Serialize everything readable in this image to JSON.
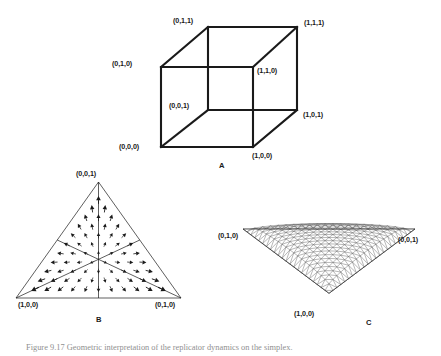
{
  "figure": {
    "background": "#ffffff",
    "ink": "#1a1a1a",
    "mesh_color": "#555555",
    "caption_text": "Figure 9.17   Geometric interpretation of the replicator dynamics on the simplex."
  },
  "panels": [
    {
      "id": "A",
      "letter": "A",
      "kind": "wireframe-cube",
      "vertex_labels": [
        "(0,1,1)",
        "(1,1,1)",
        "(0,1,0)",
        "(1,1,0)",
        "(0,0,1)",
        "(1,0,1)",
        "(0,0,0)",
        "(1,0,0)"
      ]
    },
    {
      "id": "B",
      "letter": "B",
      "kind": "simplex-vector-field",
      "vertex_labels": [
        "(0,0,1)",
        "(1,0,0)",
        "(0,1,0)"
      ]
    },
    {
      "id": "C",
      "letter": "C",
      "kind": "simplex-surface-mesh",
      "vertex_labels": [
        "(0,1,0)",
        "(0,0,1)",
        "(1,0,0)"
      ]
    }
  ],
  "chart_data": {
    "type": "diagram",
    "title": "",
    "panel_a": {
      "type": "line",
      "description": "Unit cube wireframe with all eight binary vertices labelled",
      "vertices": [
        {
          "label": "(0,0,0)",
          "coords": [
            0,
            0,
            0
          ],
          "px": [
            161,
            147
          ]
        },
        {
          "label": "(1,0,0)",
          "coords": [
            1,
            0,
            0
          ],
          "px": [
            253,
            147
          ]
        },
        {
          "label": "(1,1,0)",
          "coords": [
            1,
            1,
            0
          ],
          "px": [
            253,
            67
          ]
        },
        {
          "label": "(0,1,0)",
          "coords": [
            0,
            1,
            0
          ],
          "px": [
            161,
            67
          ]
        },
        {
          "label": "(0,0,1)",
          "coords": [
            0,
            0,
            1
          ],
          "px": [
            208,
            110
          ]
        },
        {
          "label": "(1,0,1)",
          "coords": [
            1,
            0,
            1
          ],
          "px": [
            297,
            110
          ]
        },
        {
          "label": "(1,1,1)",
          "coords": [
            1,
            1,
            1
          ],
          "px": [
            297,
            27
          ]
        },
        {
          "label": "(0,1,1)",
          "coords": [
            0,
            1,
            1
          ],
          "px": [
            208,
            27
          ]
        }
      ],
      "edges": [
        [
          0,
          1
        ],
        [
          1,
          2
        ],
        [
          2,
          3
        ],
        [
          3,
          0
        ],
        [
          4,
          5
        ],
        [
          5,
          6
        ],
        [
          6,
          7
        ],
        [
          7,
          4
        ],
        [
          0,
          4
        ],
        [
          1,
          5
        ],
        [
          2,
          6
        ],
        [
          3,
          7
        ]
      ]
    },
    "panel_b": {
      "type": "quiver",
      "description": "Vector field on the 2-simplex, divided into six regions by its three medians; arrows point outward from the barycentre toward the edges and vertices",
      "simplex_vertices": [
        {
          "label": "(0,0,1)",
          "coords": [
            0,
            0,
            1
          ]
        },
        {
          "label": "(1,0,0)",
          "coords": [
            1,
            0,
            0
          ]
        },
        {
          "label": "(0,1,0)",
          "coords": [
            0,
            1,
            0
          ]
        }
      ],
      "barycentre": [
        0.3333,
        0.3333,
        0.3333
      ],
      "median_count": 3,
      "region_count": 6,
      "lattice_rows": 13,
      "arrow_direction": "outward from centroid"
    },
    "panel_c": {
      "type": "surface",
      "description": "Triangulated dome surface over the 2-simplex seen in 3-D perspective",
      "simplex_vertices": [
        {
          "label": "(0,1,0)",
          "coords": [
            0,
            1,
            0
          ]
        },
        {
          "label": "(0,0,1)",
          "coords": [
            0,
            0,
            1
          ]
        },
        {
          "label": "(1,0,0)",
          "coords": [
            1,
            0,
            0
          ]
        }
      ],
      "grid_divisions": 22,
      "surface_shape": "dome (maximum at interior barycentre, zero at vertices)"
    }
  }
}
